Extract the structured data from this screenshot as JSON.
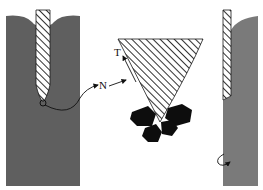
{
  "diagram": {
    "labels": {
      "normal": "N",
      "tangent": "T"
    },
    "colors": {
      "material": "#5f5f5f",
      "material_light": "#7a7a7a",
      "hatch": "#1a1a1a",
      "particles": "#0d0d0d",
      "background": "#ffffff"
    }
  }
}
